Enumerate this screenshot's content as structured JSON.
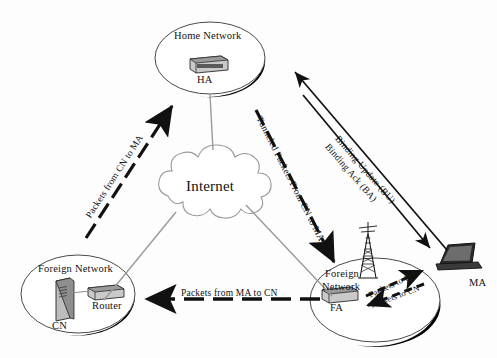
{
  "diagram": {
    "cloud": {
      "label": "Internet"
    },
    "networks": [
      {
        "id": "home-network",
        "label": "Home Network",
        "device": "HA",
        "device_type": "router-box"
      },
      {
        "id": "foreign-network-left",
        "label": "Foreign Network",
        "devices": [
          "CN",
          "Router"
        ]
      },
      {
        "id": "foreign-network-right",
        "label_line1": "Foreign",
        "label_line2": "Network",
        "device": "FA",
        "device_type": "router-box"
      }
    ],
    "nodes": {
      "ha_label": "HA",
      "cn_label": "CN",
      "router_label": "Router",
      "fa_label": "FA",
      "ma_label": "MA",
      "tower": "cell-tower-icon",
      "laptop": "laptop-icon"
    },
    "flows": [
      {
        "id": "packets-from-cn-to-ma",
        "label": "Packets from CN to MA",
        "style": "dashed",
        "direction": "up-right"
      },
      {
        "id": "tunneled-packets-from-cn-to-ma",
        "label": "Tunneled Packets From CN to MA",
        "style": "dashed",
        "direction": "down-right"
      },
      {
        "id": "binding-update",
        "label": "Binding Update (BU)",
        "style": "solid",
        "direction": "up-left"
      },
      {
        "id": "binding-ack",
        "label": "Binding Ack (BA)",
        "style": "solid",
        "direction": "down-right"
      },
      {
        "id": "packets-from-ma-to-cn",
        "label": "Packets from MA to CN",
        "style": "dashed",
        "direction": "left"
      },
      {
        "id": "packets-to-ma",
        "label": "Packets to MA",
        "style": "dashed",
        "direction": "up-right"
      },
      {
        "id": "packets-to-cn",
        "label": "Packets to CN",
        "style": "dashed",
        "direction": "down-left"
      }
    ],
    "colors": {
      "ink": "#111111",
      "link_line": "#8d8d8d",
      "ellipse_stroke": "#4a4a4a",
      "shadow": "#000000",
      "device_fill": "#b9b9b9"
    }
  }
}
